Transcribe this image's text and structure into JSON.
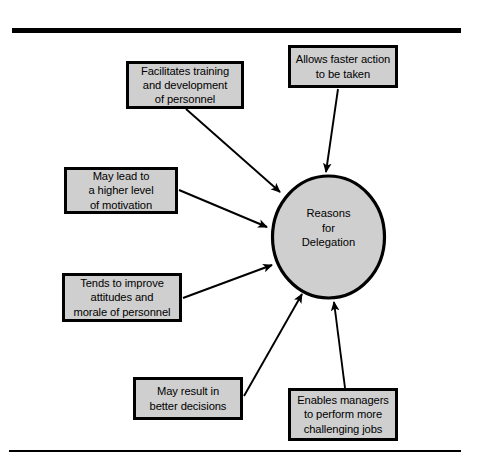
{
  "figure": {
    "type": "radial-diagram",
    "background_color": "#ffffff",
    "node_fill_color": "#cfcfcf",
    "node_border_color": "#000000",
    "arrow_color": "#000000",
    "rules": {
      "top_rule": "horizontal-rule-thick",
      "bottom_rule": "horizontal-rule-thin"
    }
  },
  "hub": {
    "shape": "ellipse",
    "label": "Reasons\nfor\nDelegation"
  },
  "nodes": [
    {
      "id": "facilitates",
      "label": "Facilitates training\nand development\nof personnel",
      "position": "top-left"
    },
    {
      "id": "allows",
      "label": "Allows faster action\nto be taken",
      "position": "top-right"
    },
    {
      "id": "maylead",
      "label": "May lead to\na higher level\nof motivation",
      "position": "left-upper"
    },
    {
      "id": "tends",
      "label": "Tends to improve\nattitudes and\nmorale of personnel",
      "position": "left-lower"
    },
    {
      "id": "mayresult",
      "label": "May result in\nbetter decisions",
      "position": "bottom-left"
    },
    {
      "id": "enables",
      "label": "Enables managers\nto perform more\nchallenging jobs",
      "position": "bottom-right"
    }
  ],
  "connectors": [
    {
      "from": "facilitates",
      "to": "hub",
      "arrowhead": "filled-triangle"
    },
    {
      "from": "allows",
      "to": "hub",
      "arrowhead": "filled-triangle"
    },
    {
      "from": "maylead",
      "to": "hub",
      "arrowhead": "filled-triangle"
    },
    {
      "from": "tends",
      "to": "hub",
      "arrowhead": "filled-triangle"
    },
    {
      "from": "mayresult",
      "to": "hub",
      "arrowhead": "filled-triangle"
    },
    {
      "from": "enables",
      "to": "hub",
      "arrowhead": "filled-triangle"
    }
  ]
}
